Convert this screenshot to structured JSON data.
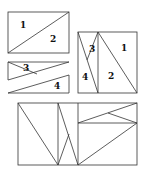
{
  "figure": {
    "rectangle": {
      "labels": [
        "1",
        "2"
      ]
    },
    "parallelogram_strip": {
      "labels": [
        "3",
        "4"
      ]
    },
    "square": {
      "labels": [
        "1",
        "2",
        "3",
        "4"
      ]
    },
    "combined_rectangle": {
      "labels": []
    }
  }
}
